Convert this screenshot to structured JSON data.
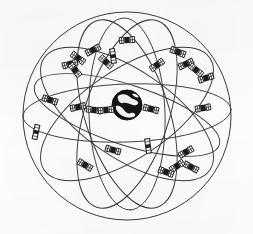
{
  "figure": {
    "kind": "line-art technical diagram",
    "clipped_caption_fragment": "— —  ——  — —— —— —",
    "background_color": "#fcfcfc",
    "ink_color": "#2a2a2a",
    "earth_fill": "#141414",
    "earth_land_color": "#f2f2f2"
  },
  "canvas": {
    "width": 253,
    "height": 234
  },
  "sphere": {
    "label": "outer celestial sphere",
    "cx": 127,
    "cy": 116,
    "r": 104,
    "stroke": "#3a3a3a",
    "stroke_width": 1.0
  },
  "earth": {
    "label": "Earth",
    "cx": 127,
    "cy": 105,
    "r": 15,
    "fill": "#141414",
    "land_patches": [
      "M -9,-9 C -5,-12 0,-11 3,-8 C 6,-5 9,-6 11,-3 C 12,-1 9,1 6,0 C 2,-1 -1,-3 -4,-2 C -7,-1 -10,-5 -9,-9 Z",
      "M -11,1 C -8,0 -5,2 -3,5 C -1,8 2,9 4,8 C 7,7 9,9 8,11 C 5,13 0,13 -4,11 C -8,9 -12,5 -11,1 Z",
      "M 5,-11 C 8,-12 11,-10 12,-8 C 10,-7 7,-8 5,-11 Z"
    ]
  },
  "equatorial_ellipse": {
    "label": "equatorial reference ellipse",
    "cx": 127,
    "cy": 113,
    "rx": 104,
    "ry": 29,
    "rotation_deg": -2
  },
  "orbital_planes": [
    {
      "name": "orbit-plane-1",
      "cx": 127,
      "cy": 114,
      "rx": 100,
      "ry": 44,
      "rotation_deg": 34
    },
    {
      "name": "orbit-plane-2",
      "cx": 127,
      "cy": 114,
      "rx": 100,
      "ry": 44,
      "rotation_deg": -34
    },
    {
      "name": "orbit-plane-3",
      "cx": 127,
      "cy": 114,
      "rx": 98,
      "ry": 42,
      "rotation_deg": 72
    },
    {
      "name": "orbit-plane-4",
      "cx": 127,
      "cy": 114,
      "rx": 98,
      "ry": 42,
      "rotation_deg": -72
    },
    {
      "name": "orbit-plane-5",
      "cx": 127,
      "cy": 114,
      "rx": 96,
      "ry": 38,
      "rotation_deg": 88
    },
    {
      "name": "orbit-plane-6",
      "cx": 127,
      "cy": 115,
      "rx": 97,
      "ry": 30,
      "rotation_deg": 18
    }
  ],
  "satellites": [
    {
      "id": "sat-01",
      "type": "winged",
      "x": 127,
      "y": 40,
      "rotation_deg": -4
    },
    {
      "id": "sat-02",
      "type": "winged",
      "x": 93,
      "y": 50,
      "rotation_deg": -28
    },
    {
      "id": "sat-03",
      "type": "winged",
      "x": 78,
      "y": 58,
      "rotation_deg": 36
    },
    {
      "id": "sat-04",
      "type": "winged",
      "x": 70,
      "y": 64,
      "rotation_deg": -16
    },
    {
      "id": "sat-05",
      "type": "winged",
      "x": 75,
      "y": 70,
      "rotation_deg": 52
    },
    {
      "id": "sat-06",
      "type": "winged",
      "x": 106,
      "y": 62,
      "rotation_deg": 42
    },
    {
      "id": "sat-07",
      "type": "winged",
      "x": 157,
      "y": 65,
      "rotation_deg": -36
    },
    {
      "id": "sat-08",
      "type": "winged",
      "x": 178,
      "y": 52,
      "rotation_deg": 22
    },
    {
      "id": "sat-09",
      "type": "winged",
      "x": 186,
      "y": 64,
      "rotation_deg": -24
    },
    {
      "id": "sat-10",
      "type": "winged",
      "x": 196,
      "y": 70,
      "rotation_deg": 40
    },
    {
      "id": "sat-11",
      "type": "winged",
      "x": 206,
      "y": 78,
      "rotation_deg": -18
    },
    {
      "id": "sat-12",
      "type": "winged",
      "x": 50,
      "y": 100,
      "rotation_deg": 18
    },
    {
      "id": "sat-13",
      "type": "winged",
      "x": 78,
      "y": 107,
      "rotation_deg": -12
    },
    {
      "id": "sat-14",
      "type": "winged",
      "x": 94,
      "y": 110,
      "rotation_deg": 8
    },
    {
      "id": "sat-15",
      "type": "winged",
      "x": 106,
      "y": 110,
      "rotation_deg": -6
    },
    {
      "id": "sat-16",
      "type": "winged",
      "x": 151,
      "y": 109,
      "rotation_deg": 14
    },
    {
      "id": "sat-17",
      "type": "winged",
      "x": 203,
      "y": 108,
      "rotation_deg": -10
    },
    {
      "id": "sat-18",
      "type": "panel",
      "x": 36,
      "y": 132,
      "rotation_deg": 12
    },
    {
      "id": "sat-19",
      "type": "panel",
      "x": 148,
      "y": 146,
      "rotation_deg": -8
    },
    {
      "id": "sat-20",
      "type": "winged",
      "x": 113,
      "y": 150,
      "rotation_deg": 16
    },
    {
      "id": "sat-21",
      "type": "winged",
      "x": 186,
      "y": 152,
      "rotation_deg": -30
    },
    {
      "id": "sat-22",
      "type": "winged",
      "x": 191,
      "y": 167,
      "rotation_deg": 28
    },
    {
      "id": "sat-23",
      "type": "winged",
      "x": 177,
      "y": 166,
      "rotation_deg": -34
    },
    {
      "id": "sat-24",
      "type": "winged",
      "x": 166,
      "y": 172,
      "rotation_deg": 20
    },
    {
      "id": "sat-25",
      "type": "winged",
      "x": 85,
      "y": 165,
      "rotation_deg": 30
    },
    {
      "id": "sat-26",
      "type": "panel",
      "x": 113,
      "y": 56,
      "rotation_deg": -8
    }
  ]
}
